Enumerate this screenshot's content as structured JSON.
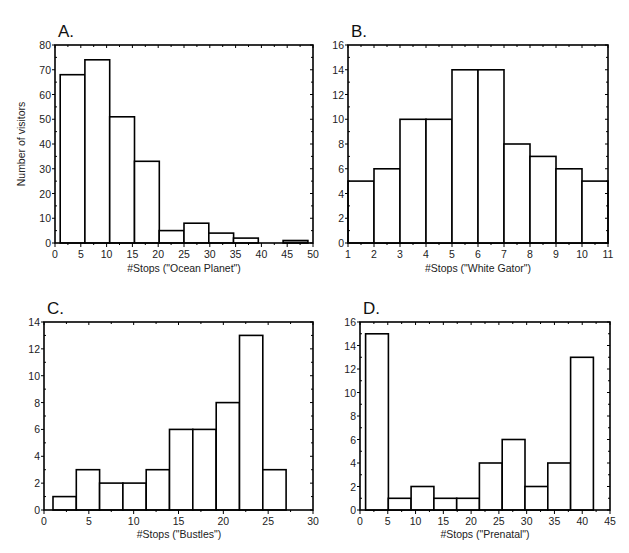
{
  "figure": {
    "ylabel_shared": "Number of visitors",
    "panels": [
      {
        "letter": "A.",
        "xlabel": "#Stops (\"Ocean Planet\")"
      },
      {
        "letter": "B.",
        "xlabel": "#Stops (\"White Gator\")"
      },
      {
        "letter": "C.",
        "xlabel": "#Stops (\"Bustles\")"
      },
      {
        "letter": "D.",
        "xlabel": "#Stops (\"Prenatal\")"
      }
    ]
  },
  "chart_data": [
    {
      "type": "bar",
      "title": "A.",
      "xlabel": "#Stops (\"Ocean Planet\")",
      "ylabel": "Number of visitors",
      "xlim": [
        0,
        50
      ],
      "ylim": [
        0,
        80
      ],
      "xticks": [
        0,
        5,
        10,
        15,
        20,
        25,
        30,
        35,
        40,
        45,
        50
      ],
      "yticks": [
        0,
        10,
        20,
        30,
        40,
        50,
        60,
        70,
        80
      ],
      "bin_edges": [
        1,
        5.8,
        10.6,
        15.4,
        20.2,
        25,
        29.8,
        34.6,
        39.4,
        44.2,
        49
      ],
      "values": [
        68,
        74,
        51,
        33,
        5,
        8,
        4,
        2,
        0,
        1
      ],
      "grid": false,
      "legend": null
    },
    {
      "type": "bar",
      "title": "B.",
      "xlabel": "#Stops (\"White Gator\")",
      "ylabel": "",
      "xlim": [
        1,
        11
      ],
      "ylim": [
        0,
        16
      ],
      "xticks": [
        1,
        2,
        3,
        4,
        5,
        6,
        7,
        8,
        9,
        10,
        11
      ],
      "yticks": [
        0,
        2,
        4,
        6,
        8,
        10,
        12,
        14,
        16
      ],
      "bin_edges": [
        1,
        2,
        3,
        4,
        5,
        6,
        7,
        8,
        9,
        10,
        11
      ],
      "values": [
        5,
        6,
        10,
        10,
        14,
        14,
        8,
        7,
        6,
        5
      ],
      "grid": false,
      "legend": null
    },
    {
      "type": "bar",
      "title": "C.",
      "xlabel": "#Stops (\"Bustles\")",
      "ylabel": "",
      "xlim": [
        0,
        30
      ],
      "ylim": [
        0,
        14
      ],
      "xticks": [
        0,
        5,
        10,
        15,
        20,
        25,
        30
      ],
      "yticks": [
        0,
        2,
        4,
        6,
        8,
        10,
        12,
        14
      ],
      "bin_edges": [
        1,
        3.6,
        6.2,
        8.8,
        11.4,
        14,
        16.6,
        19.2,
        21.8,
        24.4,
        27
      ],
      "values": [
        1,
        3,
        2,
        2,
        3,
        6,
        6,
        8,
        13,
        3
      ],
      "grid": false,
      "legend": null
    },
    {
      "type": "bar",
      "title": "D.",
      "xlabel": "#Stops (\"Prenatal\")",
      "ylabel": "",
      "xlim": [
        0,
        45
      ],
      "ylim": [
        0,
        16
      ],
      "xticks": [
        0,
        5,
        10,
        15,
        20,
        25,
        30,
        35,
        40,
        45
      ],
      "yticks": [
        0,
        2,
        4,
        6,
        8,
        10,
        12,
        14,
        16
      ],
      "bin_edges": [
        1,
        5.1,
        9.2,
        13.3,
        17.4,
        21.5,
        25.6,
        29.7,
        33.8,
        37.9,
        42
      ],
      "values": [
        15,
        1,
        2,
        1,
        1,
        4,
        6,
        2,
        4,
        13
      ],
      "grid": false,
      "legend": null
    }
  ]
}
